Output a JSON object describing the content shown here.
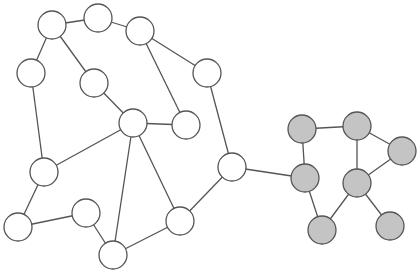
{
  "graph": {
    "width": 419,
    "height": 273,
    "node_radius": 14,
    "colors": {
      "white_fill": "#ffffff",
      "gray_fill": "#c4c4c4",
      "stroke": "#555555",
      "background": "#ffffff"
    },
    "clusters": [
      {
        "id": "white-cluster",
        "fill": "#ffffff"
      },
      {
        "id": "gray-cluster",
        "fill": "#c4c4c4"
      }
    ],
    "nodes": [
      {
        "id": "n1",
        "x": 52,
        "y": 25,
        "cluster": "white-cluster"
      },
      {
        "id": "n2",
        "x": 98,
        "y": 18,
        "cluster": "white-cluster"
      },
      {
        "id": "n3",
        "x": 140,
        "y": 31,
        "cluster": "white-cluster"
      },
      {
        "id": "n4",
        "x": 31,
        "y": 73,
        "cluster": "white-cluster"
      },
      {
        "id": "n5",
        "x": 94,
        "y": 83,
        "cluster": "white-cluster"
      },
      {
        "id": "n6",
        "x": 207,
        "y": 73,
        "cluster": "white-cluster"
      },
      {
        "id": "n7",
        "x": 133,
        "y": 123,
        "cluster": "white-cluster"
      },
      {
        "id": "n8",
        "x": 186,
        "y": 125,
        "cluster": "white-cluster"
      },
      {
        "id": "n9",
        "x": 44,
        "y": 172,
        "cluster": "white-cluster"
      },
      {
        "id": "n10",
        "x": 232,
        "y": 167,
        "cluster": "white-cluster"
      },
      {
        "id": "n11",
        "x": 18,
        "y": 227,
        "cluster": "white-cluster"
      },
      {
        "id": "n12",
        "x": 86,
        "y": 213,
        "cluster": "white-cluster"
      },
      {
        "id": "n13",
        "x": 180,
        "y": 221,
        "cluster": "white-cluster"
      },
      {
        "id": "n14",
        "x": 113,
        "y": 255,
        "cluster": "white-cluster"
      },
      {
        "id": "g1",
        "x": 302,
        "y": 129,
        "cluster": "gray-cluster"
      },
      {
        "id": "g2",
        "x": 357,
        "y": 126,
        "cluster": "gray-cluster"
      },
      {
        "id": "g3",
        "x": 402,
        "y": 151,
        "cluster": "gray-cluster"
      },
      {
        "id": "g4",
        "x": 305,
        "y": 178,
        "cluster": "gray-cluster"
      },
      {
        "id": "g5",
        "x": 357,
        "y": 183,
        "cluster": "gray-cluster"
      },
      {
        "id": "g6",
        "x": 322,
        "y": 230,
        "cluster": "gray-cluster"
      },
      {
        "id": "g7",
        "x": 390,
        "y": 226,
        "cluster": "gray-cluster"
      }
    ],
    "edges": [
      [
        "n1",
        "n2"
      ],
      [
        "n2",
        "n3"
      ],
      [
        "n1",
        "n4"
      ],
      [
        "n1",
        "n5"
      ],
      [
        "n3",
        "n6"
      ],
      [
        "n3",
        "n8"
      ],
      [
        "n5",
        "n7"
      ],
      [
        "n7",
        "n8"
      ],
      [
        "n4",
        "n9"
      ],
      [
        "n9",
        "n7"
      ],
      [
        "n9",
        "n11"
      ],
      [
        "n11",
        "n12"
      ],
      [
        "n12",
        "n14"
      ],
      [
        "n7",
        "n14"
      ],
      [
        "n7",
        "n13"
      ],
      [
        "n13",
        "n14"
      ],
      [
        "n13",
        "n10"
      ],
      [
        "n6",
        "n10"
      ],
      [
        "n10",
        "g4"
      ],
      [
        "g1",
        "g2"
      ],
      [
        "g1",
        "g4"
      ],
      [
        "g2",
        "g3"
      ],
      [
        "g2",
        "g5"
      ],
      [
        "g3",
        "g5"
      ],
      [
        "g4",
        "g6"
      ],
      [
        "g5",
        "g6"
      ],
      [
        "g5",
        "g7"
      ]
    ]
  }
}
